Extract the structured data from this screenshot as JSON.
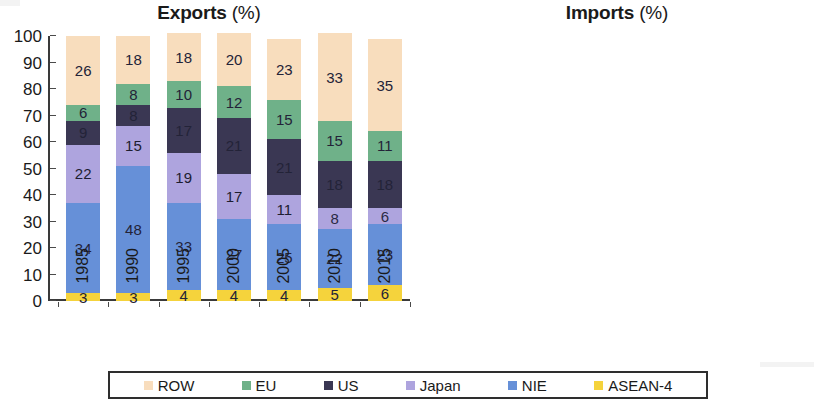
{
  "figure": {
    "panels": [
      {
        "id": "exports",
        "title": "Exports",
        "unit": "(%)"
      },
      {
        "id": "imports",
        "title": "Imports",
        "unit": "(%)"
      }
    ]
  },
  "axis": {
    "y_ticks": [
      "0",
      "10",
      "20",
      "30",
      "40",
      "50",
      "60",
      "70",
      "80",
      "90",
      "100"
    ],
    "x_ticks": [
      "1985",
      "1990",
      "1995",
      "2000",
      "2005",
      "2010",
      "2015"
    ]
  },
  "legend": {
    "items": [
      {
        "label": "ROW",
        "color": "#f8ddbd"
      },
      {
        "label": "EU",
        "color": "#6fb189"
      },
      {
        "label": "US",
        "color": "#3a3753"
      },
      {
        "label": "Japan",
        "color": "#aea4de"
      },
      {
        "label": "NIE",
        "color": "#6690d8"
      },
      {
        "label": "ASEAN-4",
        "color": "#f5d33c"
      }
    ]
  },
  "chart_data": [
    {
      "type": "bar",
      "stacked": true,
      "title": "Exports (%)",
      "xlabel": "",
      "ylabel": "",
      "ylim": [
        0,
        100
      ],
      "grid": false,
      "legend_position": "bottom",
      "categories": [
        "1985",
        "1990",
        "1995",
        "2000",
        "2005",
        "2010",
        "2015"
      ],
      "series": [
        {
          "name": "ASEAN-4",
          "color": "#f5d33c",
          "values": [
            3,
            3,
            4,
            4,
            4,
            5,
            6
          ]
        },
        {
          "name": "NIE",
          "color": "#6690d8",
          "values": [
            34,
            48,
            33,
            27,
            25,
            22,
            23
          ]
        },
        {
          "name": "Japan",
          "color": "#aea4de",
          "values": [
            22,
            15,
            19,
            17,
            11,
            8,
            6
          ]
        },
        {
          "name": "US",
          "color": "#3a3753",
          "values": [
            9,
            8,
            17,
            21,
            21,
            18,
            18
          ]
        },
        {
          "name": "EU",
          "color": "#6fb189",
          "values": [
            6,
            8,
            10,
            12,
            15,
            15,
            11
          ]
        },
        {
          "name": "ROW",
          "color": "#f8ddbd",
          "values": [
            26,
            18,
            18,
            20,
            23,
            33,
            35
          ]
        }
      ]
    },
    {
      "type": "bar",
      "stacked": true,
      "title": "Imports (%)",
      "xlabel": "",
      "ylabel": "",
      "ylim": [
        0,
        100
      ],
      "grid": false,
      "legend_position": "bottom",
      "categories": [
        "1985",
        "1990",
        "1995",
        "2000",
        "2005",
        "2010",
        "2015"
      ],
      "series": [
        {
          "name": "ASEAN-4",
          "color": "#f5d33c",
          "values": [
            2,
            4,
            5,
            7,
            8,
            9,
            8
          ]
        },
        {
          "name": "NIE",
          "color": "#6690d8",
          "values": [
            12,
            33,
            28,
            28,
            27,
            21,
            22
          ]
        },
        {
          "name": "Japan",
          "color": "#aea4de",
          "values": [
            36,
            14,
            22,
            18,
            15,
            13,
            9
          ]
        },
        {
          "name": "US",
          "color": "#3a3753",
          "values": [
            12,
            12,
            12,
            10,
            7,
            7,
            9
          ]
        },
        {
          "name": "EU",
          "color": "#6fb189",
          "values": [
            12,
            13,
            13,
            11,
            9,
            10,
            11
          ]
        },
        {
          "name": "ROW",
          "color": "#f8ddbd",
          "values": [
            26,
            23,
            20,
            26,
            32,
            41,
            41
          ]
        }
      ]
    }
  ]
}
